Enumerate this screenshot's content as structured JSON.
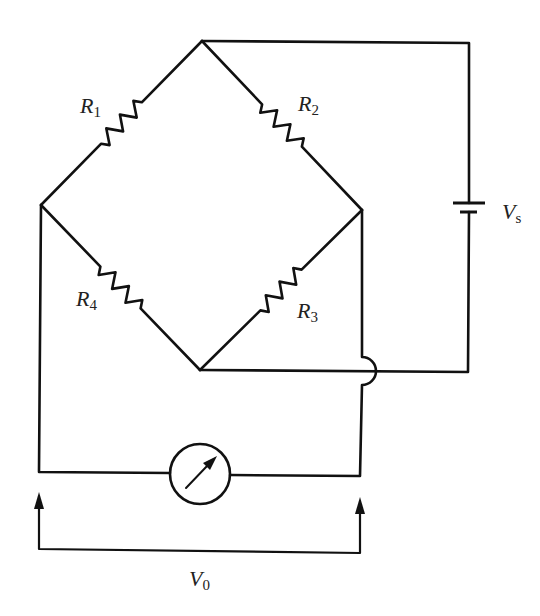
{
  "diagram": {
    "stroke_color": "#111111",
    "background": "#ffffff",
    "nodes": {
      "top": [
        202,
        41
      ],
      "left": [
        41,
        205
      ],
      "right": [
        362,
        210
      ],
      "bottom": [
        200,
        370
      ]
    },
    "resistors": [
      {
        "id": "R1",
        "symbol": "R",
        "subscript": "1",
        "from": "left",
        "to": "top",
        "label_pos": [
          80,
          113
        ]
      },
      {
        "id": "R2",
        "symbol": "R",
        "subscript": "2",
        "from": "top",
        "to": "right",
        "label_pos": [
          298,
          110
        ]
      },
      {
        "id": "R3",
        "symbol": "R",
        "subscript": "3",
        "from": "bottom",
        "to": "right",
        "label_pos": [
          297,
          318
        ]
      },
      {
        "id": "R4",
        "symbol": "R",
        "subscript": "4",
        "from": "left",
        "to": "bottom",
        "label_pos": [
          76,
          306
        ]
      }
    ],
    "source": {
      "id": "Vs",
      "symbol": "V",
      "subscript": "s",
      "type": "battery",
      "x": 469,
      "long_plate_y": 203,
      "short_plate_y": 212,
      "label_pos": [
        502,
        220
      ]
    },
    "meter": {
      "id": "galvanometer",
      "type": "meter",
      "center": [
        200,
        474
      ],
      "radius": 30
    },
    "output": {
      "id": "V0",
      "symbol": "V",
      "subscript": "0",
      "label_pos": [
        189,
        586
      ]
    },
    "labels": {
      "R1": {
        "symbol": "R",
        "sub": "1"
      },
      "R2": {
        "symbol": "R",
        "sub": "2"
      },
      "R3": {
        "symbol": "R",
        "sub": "3"
      },
      "R4": {
        "symbol": "R",
        "sub": "4"
      },
      "Vs": {
        "symbol": "V",
        "sub": "s"
      },
      "V0": {
        "symbol": "V",
        "sub": "0"
      }
    }
  }
}
